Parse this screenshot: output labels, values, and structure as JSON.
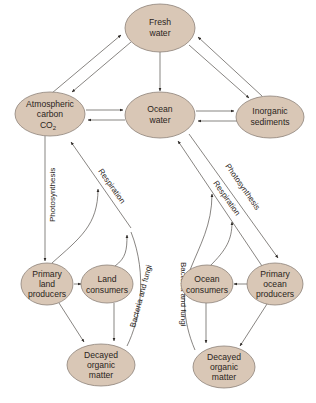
{
  "nodes": {
    "fresh_water": {
      "lines": [
        "Fresh",
        "water"
      ]
    },
    "atmospheric_carbon": {
      "lines": [
        "Atmospheric",
        "carbon",
        "CO",
        "2"
      ]
    },
    "ocean_water": {
      "lines": [
        "Ocean",
        "water"
      ]
    },
    "inorganic_sediments": {
      "lines": [
        "Inorganic",
        "sediments"
      ]
    },
    "primary_land_producers": {
      "lines": [
        "Primary",
        "land",
        "producers"
      ]
    },
    "land_consumers": {
      "lines": [
        "Land",
        "consumers"
      ]
    },
    "decayed_land": {
      "lines": [
        "Decayed",
        "organic",
        "matter"
      ]
    },
    "ocean_consumers": {
      "lines": [
        "Ocean",
        "consumers"
      ]
    },
    "primary_ocean_producers": {
      "lines": [
        "Primary",
        "ocean",
        "producers"
      ]
    },
    "decayed_ocean": {
      "lines": [
        "Decayed",
        "organic",
        "matter"
      ]
    }
  },
  "edge_labels": {
    "land_photosynthesis": "Photosynthesis",
    "land_respiration": "Respiration",
    "land_bacteria": "Bacteria and fungi",
    "ocean_photosynthesis": "Photosynthesis",
    "ocean_respiration": "Respiration",
    "ocean_bacteria": "Bacteria and fungi"
  },
  "colors": {
    "node_fill": "#d9c7b6",
    "node_stroke": "#8d8178",
    "edge": "#55504c",
    "text": "#2a2420"
  }
}
